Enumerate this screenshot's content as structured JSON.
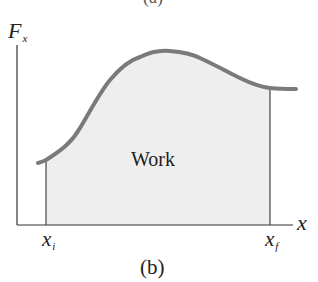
{
  "figure": {
    "partial_top_label": "(a)",
    "caption": "(b)",
    "y_axis_label": {
      "main": "F",
      "sub": "x"
    },
    "x_axis_label": "x",
    "lower_limit_label": {
      "main": "x",
      "sub": "i"
    },
    "upper_limit_label": {
      "main": "x",
      "sub": "f"
    },
    "area_label": "Work"
  },
  "colors": {
    "curve": "#7a7a7a",
    "area_fill": "#eeeeee",
    "axes": "#333333",
    "limit_lines": "#444444",
    "text": "#222222"
  },
  "geometry": {
    "axes_origin": [
      17,
      225
    ],
    "y_axis_top": 45,
    "x_axis_right": 293,
    "x_i": 46,
    "x_f": 270,
    "curve_points": [
      [
        38,
        163
      ],
      [
        46,
        160
      ],
      [
        80,
        128
      ],
      [
        110,
        80
      ],
      [
        140,
        57
      ],
      [
        170,
        51
      ],
      [
        200,
        58
      ],
      [
        240,
        78
      ],
      [
        270,
        88
      ],
      [
        296,
        89
      ]
    ]
  }
}
